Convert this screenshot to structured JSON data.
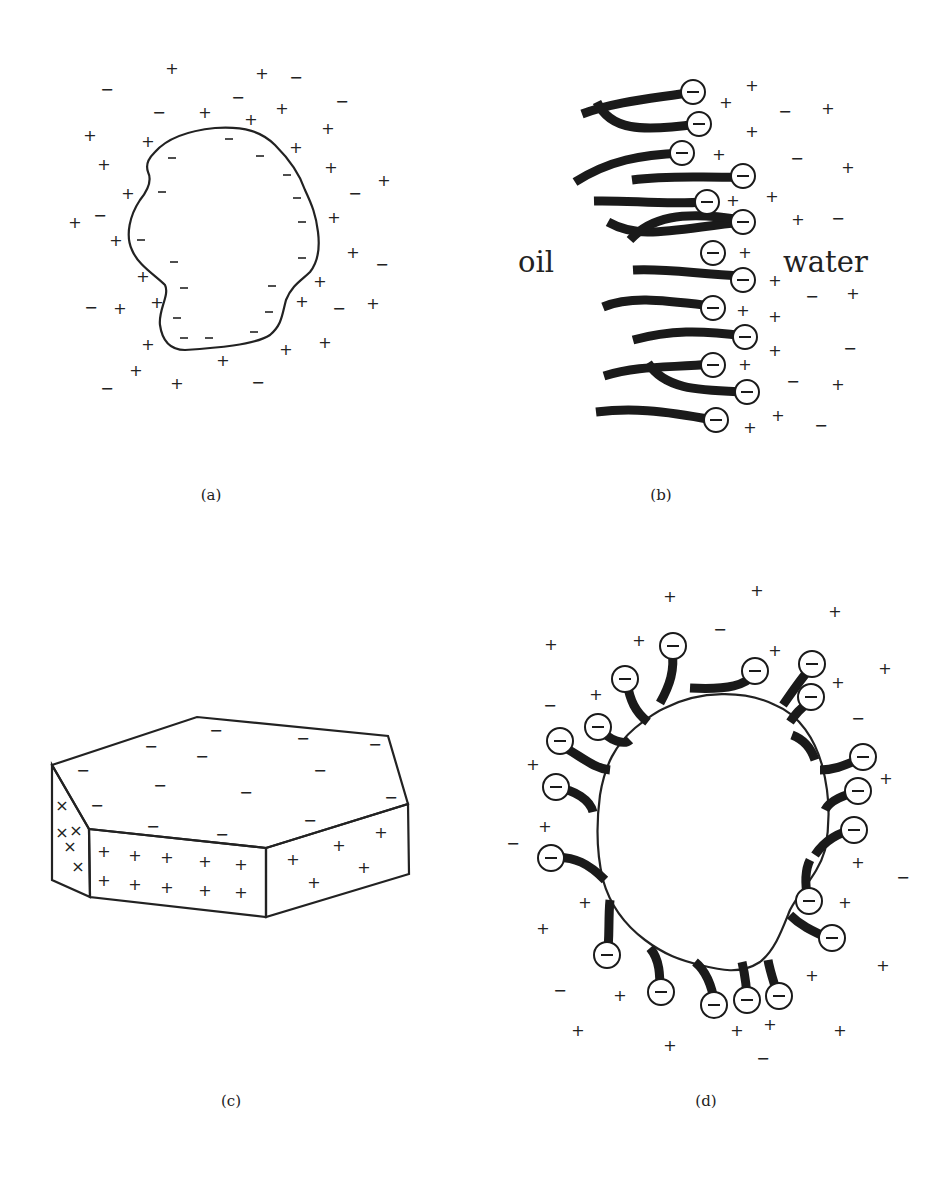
{
  "figure": {
    "panels": [
      {
        "id": "a",
        "label": "(a)",
        "description": "Irregular hatched particle with negative surface charges surrounded by diffuse cloud of positive and negative ions"
      },
      {
        "id": "b",
        "label": "(b)",
        "description": "Anionic surfactant molecules at an oil-water interface",
        "left_medium": "oil",
        "right_medium": "water"
      },
      {
        "id": "c",
        "label": "(c)",
        "description": "Hexagonal clay platelet: negative charges on faces, positive charges on edges"
      },
      {
        "id": "d",
        "label": "(d)",
        "description": "Hatched particle with adsorbed anionic surfactant molecules, heads pointing outward, surrounded by ions"
      }
    ],
    "symbols": {
      "positive": "+",
      "negative": "−"
    },
    "colors": {
      "ink": "#222222",
      "background": "#ffffff"
    }
  }
}
